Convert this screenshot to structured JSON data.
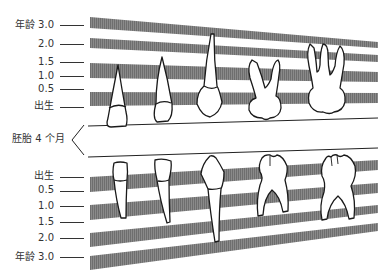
{
  "colors": {
    "band": "#7a7a7a",
    "line": "#222222",
    "tooth_fill": "#ffffff",
    "tooth_stroke": "#1a1a1a",
    "label": "#333333"
  },
  "upper": {
    "labels": [
      {
        "text": "年龄 3.0",
        "y": 25
      },
      {
        "text": "2.0",
        "y": 44
      },
      {
        "text": "1.5",
        "y": 62
      },
      {
        "text": "1.0",
        "y": 76
      },
      {
        "text": "0.5",
        "y": 89
      },
      {
        "text": "出生",
        "y": 106
      }
    ]
  },
  "middle": {
    "label": "胚胎 4 个月"
  },
  "lower": {
    "labels": [
      {
        "text": "出生",
        "y": 176
      },
      {
        "text": "0.5",
        "y": 190
      },
      {
        "text": "1.0",
        "y": 206
      },
      {
        "text": "1.5",
        "y": 222
      },
      {
        "text": "2.0",
        "y": 238
      },
      {
        "text": "年龄 3.0",
        "y": 257
      }
    ]
  },
  "teeth": {
    "upper": [
      "中切牙",
      "侧切牙",
      "尖牙",
      "第一乳磨牙",
      "第二乳磨牙"
    ],
    "lower": [
      "中切牙",
      "侧切牙",
      "尖牙",
      "第一乳磨牙",
      "第二乳磨牙"
    ]
  }
}
